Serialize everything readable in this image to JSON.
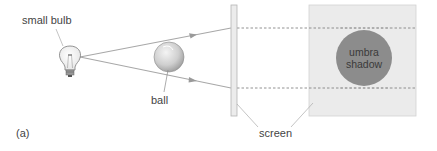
{
  "labels": {
    "bulb": "small bulb",
    "ball": "ball",
    "screen": "screen",
    "panel_label": "(a)",
    "umbra_line1": "umbra",
    "umbra_line2": "shadow"
  },
  "colors": {
    "ray": "#a8a8a8",
    "screen_bar": "#ececec",
    "panel": "#ebebeb",
    "umbra": "#8c8c8c",
    "dash": "#777777",
    "leader": "#aaaaaa"
  }
}
